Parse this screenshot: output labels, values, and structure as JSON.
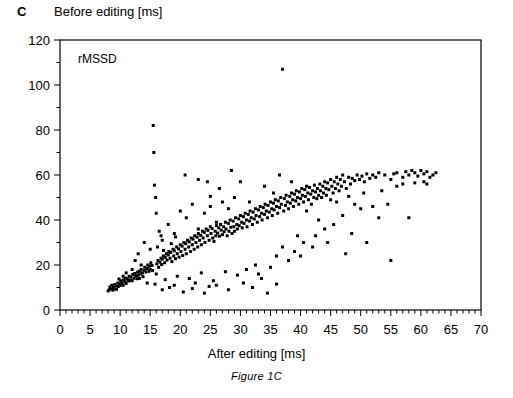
{
  "panel": {
    "letter": "C",
    "caption": "Figure 1C"
  },
  "chart_data": {
    "type": "scatter",
    "title": "",
    "annotation": "rMSSD",
    "xlabel": "After editing [ms]",
    "ylabel": "Before editing [ms]",
    "xlim": [
      0,
      70
    ],
    "ylim": [
      0,
      120
    ],
    "x_major_step": 5,
    "x_minor_step": 1,
    "y_major_step": 20,
    "y_minor_step": 10,
    "xticks": [
      0,
      5,
      10,
      15,
      20,
      25,
      30,
      35,
      40,
      45,
      50,
      55,
      60,
      65,
      70
    ],
    "yticks": [
      0,
      20,
      40,
      60,
      80,
      100,
      120
    ],
    "grid": false,
    "legend": "none",
    "marker": "square",
    "marker_size_px": 3,
    "marker_color": "#000000",
    "points": [
      [
        8.0,
        8.5
      ],
      [
        8.2,
        9.0
      ],
      [
        8.3,
        10.2
      ],
      [
        8.5,
        9.4
      ],
      [
        8.6,
        11.0
      ],
      [
        8.8,
        8.8
      ],
      [
        8.9,
        10.0
      ],
      [
        9.0,
        9.5
      ],
      [
        9.1,
        11.3
      ],
      [
        9.3,
        10.7
      ],
      [
        9.4,
        9.2
      ],
      [
        9.6,
        12.0
      ],
      [
        9.7,
        10.4
      ],
      [
        9.9,
        11.6
      ],
      [
        10.0,
        10.9
      ],
      [
        10.1,
        13.0
      ],
      [
        10.3,
        12.2
      ],
      [
        10.5,
        11.0
      ],
      [
        10.6,
        13.5
      ],
      [
        10.8,
        12.6
      ],
      [
        10.9,
        14.2
      ],
      [
        11.0,
        11.8
      ],
      [
        11.2,
        13.8
      ],
      [
        11.4,
        12.9
      ],
      [
        11.5,
        15.0
      ],
      [
        11.7,
        13.2
      ],
      [
        11.8,
        14.6
      ],
      [
        12.0,
        13.0
      ],
      [
        12.1,
        15.8
      ],
      [
        12.3,
        14.1
      ],
      [
        12.4,
        16.2
      ],
      [
        12.6,
        15.2
      ],
      [
        12.8,
        13.9
      ],
      [
        12.9,
        16.8
      ],
      [
        13.0,
        15.4
      ],
      [
        13.2,
        17.3
      ],
      [
        13.4,
        16.0
      ],
      [
        13.5,
        18.0
      ],
      [
        13.7,
        16.5
      ],
      [
        13.8,
        14.8
      ],
      [
        14.0,
        17.6
      ],
      [
        14.1,
        19.0
      ],
      [
        14.3,
        16.9
      ],
      [
        14.5,
        18.4
      ],
      [
        14.6,
        20.0
      ],
      [
        14.8,
        17.2
      ],
      [
        14.9,
        19.5
      ],
      [
        15.0,
        18.0
      ],
      [
        15.1,
        21.0
      ],
      [
        15.3,
        19.8
      ],
      [
        15.4,
        17.5
      ],
      [
        15.5,
        82.0
      ],
      [
        15.6,
        70.0
      ],
      [
        15.7,
        55.5
      ],
      [
        15.9,
        50.0
      ],
      [
        16.0,
        43.0
      ],
      [
        16.1,
        20.5
      ],
      [
        16.3,
        22.0
      ],
      [
        16.4,
        19.0
      ],
      [
        16.6,
        21.3
      ],
      [
        16.8,
        23.0
      ],
      [
        16.9,
        20.2
      ],
      [
        17.0,
        22.6
      ],
      [
        17.2,
        24.0
      ],
      [
        17.4,
        21.0
      ],
      [
        17.5,
        23.4
      ],
      [
        17.7,
        25.0
      ],
      [
        17.8,
        22.2
      ],
      [
        18.0,
        24.5
      ],
      [
        18.1,
        26.0
      ],
      [
        18.3,
        23.0
      ],
      [
        18.4,
        25.6
      ],
      [
        18.6,
        21.5
      ],
      [
        18.8,
        27.0
      ],
      [
        18.9,
        24.0
      ],
      [
        19.0,
        26.3
      ],
      [
        19.2,
        22.8
      ],
      [
        19.4,
        28.0
      ],
      [
        19.5,
        25.0
      ],
      [
        19.7,
        27.2
      ],
      [
        19.8,
        23.5
      ],
      [
        20.0,
        29.0
      ],
      [
        20.1,
        26.0
      ],
      [
        20.3,
        28.4
      ],
      [
        20.4,
        24.2
      ],
      [
        20.6,
        30.0
      ],
      [
        20.8,
        27.0
      ],
      [
        20.9,
        29.5
      ],
      [
        21.0,
        25.0
      ],
      [
        21.2,
        31.0
      ],
      [
        21.4,
        28.0
      ],
      [
        21.5,
        30.3
      ],
      [
        21.7,
        26.0
      ],
      [
        21.8,
        32.0
      ],
      [
        22.0,
        29.0
      ],
      [
        22.1,
        31.5
      ],
      [
        22.3,
        27.0
      ],
      [
        22.4,
        33.0
      ],
      [
        22.6,
        30.0
      ],
      [
        22.8,
        32.4
      ],
      [
        22.9,
        28.0
      ],
      [
        23.0,
        34.0
      ],
      [
        23.2,
        31.0
      ],
      [
        23.4,
        33.2
      ],
      [
        23.5,
        29.0
      ],
      [
        23.7,
        35.0
      ],
      [
        23.8,
        32.0
      ],
      [
        24.0,
        34.5
      ],
      [
        24.1,
        30.0
      ],
      [
        24.3,
        36.0
      ],
      [
        24.5,
        33.0
      ],
      [
        24.6,
        35.4
      ],
      [
        24.8,
        31.0
      ],
      [
        25.0,
        37.0
      ],
      [
        25.1,
        34.0
      ],
      [
        25.3,
        36.2
      ],
      [
        25.4,
        32.0
      ],
      [
        25.6,
        30.5
      ],
      [
        25.8,
        35.0
      ],
      [
        25.9,
        33.0
      ],
      [
        26.0,
        37.5
      ],
      [
        26.2,
        34.2
      ],
      [
        26.4,
        36.5
      ],
      [
        26.5,
        32.8
      ],
      [
        26.7,
        38.0
      ],
      [
        26.8,
        35.5
      ],
      [
        27.0,
        33.5
      ],
      [
        27.2,
        37.0
      ],
      [
        27.3,
        34.8
      ],
      [
        27.5,
        39.0
      ],
      [
        27.6,
        36.0
      ],
      [
        27.8,
        33.0
      ],
      [
        28.0,
        38.5
      ],
      [
        28.1,
        35.0
      ],
      [
        28.3,
        40.0
      ],
      [
        28.4,
        36.8
      ],
      [
        28.6,
        34.0
      ],
      [
        28.8,
        39.5
      ],
      [
        28.9,
        37.0
      ],
      [
        29.0,
        35.0
      ],
      [
        29.2,
        41.0
      ],
      [
        29.4,
        38.0
      ],
      [
        29.5,
        36.0
      ],
      [
        29.7,
        40.5
      ],
      [
        29.8,
        37.5
      ],
      [
        30.0,
        42.0
      ],
      [
        30.2,
        39.0
      ],
      [
        30.3,
        36.5
      ],
      [
        30.5,
        41.5
      ],
      [
        30.6,
        38.5
      ],
      [
        30.8,
        43.0
      ],
      [
        31.0,
        40.0
      ],
      [
        31.1,
        37.0
      ],
      [
        31.3,
        42.5
      ],
      [
        31.5,
        39.5
      ],
      [
        31.6,
        44.0
      ],
      [
        31.8,
        41.0
      ],
      [
        32.0,
        38.0
      ],
      [
        32.1,
        43.5
      ],
      [
        32.3,
        40.5
      ],
      [
        32.5,
        45.0
      ],
      [
        32.6,
        42.0
      ],
      [
        32.8,
        39.0
      ],
      [
        33.0,
        44.5
      ],
      [
        33.2,
        41.5
      ],
      [
        33.3,
        46.0
      ],
      [
        33.5,
        43.0
      ],
      [
        33.6,
        40.0
      ],
      [
        33.8,
        45.5
      ],
      [
        34.0,
        42.5
      ],
      [
        34.1,
        47.0
      ],
      [
        34.3,
        44.0
      ],
      [
        34.5,
        41.0
      ],
      [
        34.6,
        46.5
      ],
      [
        34.8,
        43.5
      ],
      [
        35.0,
        48.0
      ],
      [
        35.2,
        45.0
      ],
      [
        35.3,
        42.0
      ],
      [
        35.5,
        47.5
      ],
      [
        35.6,
        44.5
      ],
      [
        35.8,
        49.0
      ],
      [
        36.0,
        46.0
      ],
      [
        36.2,
        43.0
      ],
      [
        36.3,
        48.5
      ],
      [
        36.5,
        45.5
      ],
      [
        36.7,
        50.0
      ],
      [
        36.8,
        47.0
      ],
      [
        37.0,
        107.0
      ],
      [
        37.2,
        44.0
      ],
      [
        37.3,
        49.5
      ],
      [
        37.5,
        46.5
      ],
      [
        37.6,
        51.0
      ],
      [
        37.8,
        48.0
      ],
      [
        38.0,
        45.0
      ],
      [
        38.2,
        50.5
      ],
      [
        38.3,
        47.5
      ],
      [
        38.5,
        52.0
      ],
      [
        38.7,
        49.0
      ],
      [
        38.8,
        46.0
      ],
      [
        39.0,
        51.5
      ],
      [
        39.2,
        48.5
      ],
      [
        39.3,
        53.0
      ],
      [
        39.5,
        50.0
      ],
      [
        39.7,
        47.0
      ],
      [
        39.8,
        52.5
      ],
      [
        40.0,
        49.5
      ],
      [
        40.2,
        54.0
      ],
      [
        40.3,
        51.0
      ],
      [
        40.5,
        48.0
      ],
      [
        40.7,
        53.5
      ],
      [
        40.8,
        50.5
      ],
      [
        41.0,
        55.0
      ],
      [
        41.2,
        52.0
      ],
      [
        41.3,
        49.0
      ],
      [
        41.5,
        54.5
      ],
      [
        41.7,
        51.5
      ],
      [
        41.8,
        47.0
      ],
      [
        42.0,
        53.0
      ],
      [
        42.2,
        50.0
      ],
      [
        42.3,
        55.5
      ],
      [
        42.5,
        52.5
      ],
      [
        42.7,
        49.5
      ],
      [
        42.8,
        54.0
      ],
      [
        43.0,
        51.0
      ],
      [
        43.2,
        56.0
      ],
      [
        43.3,
        53.0
      ],
      [
        43.5,
        50.0
      ],
      [
        43.7,
        55.0
      ],
      [
        43.8,
        52.0
      ],
      [
        44.0,
        57.0
      ],
      [
        44.2,
        54.0
      ],
      [
        44.3,
        51.0
      ],
      [
        44.5,
        56.5
      ],
      [
        44.7,
        53.5
      ],
      [
        45.0,
        58.0
      ],
      [
        45.2,
        55.0
      ],
      [
        45.4,
        52.0
      ],
      [
        45.6,
        57.0
      ],
      [
        45.8,
        54.0
      ],
      [
        46.0,
        59.0
      ],
      [
        46.2,
        56.0
      ],
      [
        46.4,
        53.0
      ],
      [
        46.6,
        58.0
      ],
      [
        46.8,
        55.0
      ],
      [
        47.0,
        60.0
      ],
      [
        47.3,
        57.0
      ],
      [
        47.6,
        54.0
      ],
      [
        48.0,
        59.0
      ],
      [
        48.3,
        56.0
      ],
      [
        48.6,
        58.5
      ],
      [
        49.0,
        57.5
      ],
      [
        49.4,
        60.0
      ],
      [
        49.8,
        58.0
      ],
      [
        50.2,
        59.5
      ],
      [
        50.6,
        57.0
      ],
      [
        51.0,
        60.5
      ],
      [
        51.5,
        58.5
      ],
      [
        52.0,
        60.0
      ],
      [
        52.5,
        59.0
      ],
      [
        53.0,
        61.0
      ],
      [
        54.0,
        60.0
      ],
      [
        55.0,
        58.0
      ],
      [
        55.5,
        60.5
      ],
      [
        56.0,
        61.0
      ],
      [
        57.0,
        59.0
      ],
      [
        57.5,
        61.5
      ],
      [
        58.0,
        60.0
      ],
      [
        58.5,
        62.0
      ],
      [
        59.0,
        61.0
      ],
      [
        59.5,
        59.5
      ],
      [
        60.0,
        62.0
      ],
      [
        60.5,
        60.5
      ],
      [
        61.0,
        61.5
      ],
      [
        61.5,
        59.0
      ],
      [
        62.0,
        60.0
      ],
      [
        62.5,
        61.0
      ],
      [
        12.5,
        22.0
      ],
      [
        13.0,
        25.0
      ],
      [
        13.5,
        20.0
      ],
      [
        14.0,
        30.0
      ],
      [
        15.0,
        27.0
      ],
      [
        16.5,
        35.0
      ],
      [
        17.0,
        31.0
      ],
      [
        18.0,
        38.0
      ],
      [
        19.0,
        34.0
      ],
      [
        20.0,
        44.0
      ],
      [
        21.0,
        41.0
      ],
      [
        22.0,
        47.0
      ],
      [
        23.0,
        36.0
      ],
      [
        24.0,
        43.0
      ],
      [
        25.0,
        46.0
      ],
      [
        26.0,
        39.0
      ],
      [
        27.0,
        48.0
      ],
      [
        28.0,
        45.0
      ],
      [
        29.0,
        50.0
      ],
      [
        30.0,
        42.0
      ],
      [
        13.2,
        14.0
      ],
      [
        14.5,
        12.0
      ],
      [
        16.0,
        16.0
      ],
      [
        17.5,
        13.5
      ],
      [
        19.5,
        15.0
      ],
      [
        21.5,
        14.0
      ],
      [
        23.5,
        16.5
      ],
      [
        25.5,
        13.0
      ],
      [
        27.5,
        17.0
      ],
      [
        29.5,
        15.5
      ],
      [
        31.0,
        18.0
      ],
      [
        33.0,
        16.0
      ],
      [
        35.0,
        19.0
      ],
      [
        20.5,
        8.0
      ],
      [
        22.0,
        9.5
      ],
      [
        24.0,
        7.5
      ],
      [
        26.0,
        11.0
      ],
      [
        28.0,
        9.0
      ],
      [
        30.5,
        12.0
      ],
      [
        32.0,
        10.0
      ],
      [
        33.5,
        14.0
      ],
      [
        36.0,
        11.5
      ],
      [
        38.0,
        22.0
      ],
      [
        39.0,
        26.0
      ],
      [
        40.5,
        30.0
      ],
      [
        42.0,
        28.0
      ],
      [
        34.0,
        55.0
      ],
      [
        35.5,
        52.0
      ],
      [
        38.5,
        57.0
      ],
      [
        41.0,
        44.0
      ],
      [
        43.0,
        40.0
      ],
      [
        44.0,
        36.0
      ],
      [
        45.5,
        38.0
      ],
      [
        47.0,
        42.0
      ],
      [
        48.5,
        34.0
      ],
      [
        50.0,
        45.0
      ],
      [
        51.0,
        30.0
      ],
      [
        53.0,
        41.0
      ],
      [
        54.5,
        47.0
      ],
      [
        55.0,
        22.0
      ],
      [
        58.0,
        41.0
      ],
      [
        47.5,
        25.0
      ],
      [
        44.5,
        30.0
      ],
      [
        42.5,
        33.0
      ],
      [
        16.2,
        28.0
      ],
      [
        16.8,
        33.0
      ],
      [
        17.2,
        26.5
      ],
      [
        18.5,
        29.5
      ],
      [
        19.2,
        32.5
      ],
      [
        12.0,
        18.0
      ],
      [
        11.0,
        16.5
      ],
      [
        10.5,
        15.0
      ],
      [
        9.8,
        13.8
      ],
      [
        23.0,
        58.0
      ],
      [
        24.5,
        57.0
      ],
      [
        25.0,
        50.5
      ],
      [
        26.5,
        54.0
      ],
      [
        31.5,
        48.0
      ],
      [
        36.5,
        60.0
      ],
      [
        30.0,
        57.0
      ],
      [
        28.5,
        62.0
      ],
      [
        20.8,
        60.0
      ],
      [
        22.5,
        12.0
      ],
      [
        24.8,
        10.5
      ],
      [
        19.0,
        11.0
      ],
      [
        18.2,
        10.0
      ],
      [
        17.0,
        9.0
      ],
      [
        15.8,
        11.5
      ],
      [
        34.5,
        7.5
      ],
      [
        32.5,
        20.0
      ],
      [
        36.0,
        24.0
      ],
      [
        37.0,
        28.0
      ],
      [
        39.5,
        33.0
      ],
      [
        40.0,
        24.0
      ],
      [
        46.0,
        48.0
      ],
      [
        49.0,
        47.0
      ],
      [
        52.0,
        46.0
      ],
      [
        56.0,
        55.0
      ],
      [
        57.0,
        56.0
      ],
      [
        59.0,
        56.5
      ],
      [
        60.5,
        57.0
      ],
      [
        61.0,
        56.0
      ],
      [
        53.5,
        53.0
      ],
      [
        50.5,
        52.0
      ],
      [
        48.0,
        50.5
      ],
      [
        45.0,
        49.0
      ]
    ]
  }
}
